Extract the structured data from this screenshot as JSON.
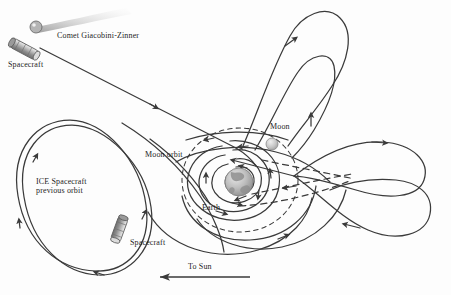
{
  "figure": {
    "background_color": "#fdfdfd",
    "line_color": "#3a3a3a"
  },
  "labels": {
    "comet": "Comet Giacobini-Zinner",
    "spacecraft_top": "Spacecraft",
    "spacecraft_bottom": "Spacecraft",
    "ice_orbit_line1": "ICE Spacecraft",
    "ice_orbit_line2": "previous orbit",
    "moon_orbit": "Moon orbit",
    "moon": "Moon",
    "earth": "Earth",
    "to_sun": "To Sun"
  },
  "bodies": {
    "earth": {
      "name": "earth-globe",
      "cx": 239,
      "cy": 182,
      "r": 14,
      "color": "#b9b9b9"
    },
    "moon": {
      "name": "moon-sphere",
      "cx": 272,
      "cy": 144,
      "r": 6,
      "color": "#c9c9c9"
    },
    "comet": {
      "name": "comet-nucleus",
      "cx": 36,
      "cy": 27,
      "r": 6,
      "color": "#a8a8a8",
      "tail_color": "#d6d6d6"
    }
  },
  "orbits": {
    "moon_orbit": {
      "style": "dashed",
      "cx": 240,
      "cy": 180,
      "rx": 58,
      "ry": 52
    },
    "ice_previous_orbit": {
      "style": "solid-double",
      "description": "large tilted ellipse lower left"
    }
  },
  "annotations": {
    "to_sun_arrow_direction": "left"
  }
}
